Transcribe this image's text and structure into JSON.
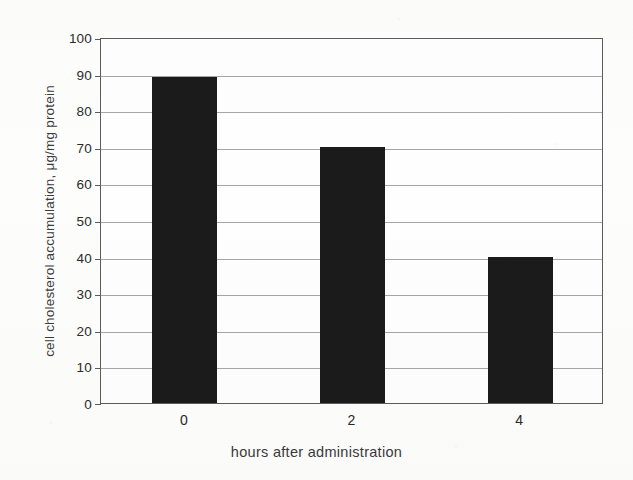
{
  "chart_data": {
    "type": "bar",
    "title": "",
    "categories": [
      "0",
      "2",
      "4"
    ],
    "values": [
      89,
      70,
      40
    ],
    "xlabel": "hours after administration",
    "ylabel": "cell cholesterol accumulation, μg/mg protein",
    "ylim": [
      0,
      100
    ],
    "ytick_labels": [
      "100",
      "90",
      "80",
      "70",
      "60",
      "50",
      "40",
      "30",
      "20",
      "10",
      "0"
    ],
    "ytick_values": [
      100,
      90,
      80,
      70,
      60,
      50,
      40,
      30,
      20,
      10,
      0
    ],
    "ytick_step": 10,
    "grid": "horizontal",
    "legend": "none",
    "series": [
      {
        "name": "cell cholesterol accumulation",
        "values": [
          89,
          70,
          40
        ],
        "color": "#1b1b1b"
      }
    ],
    "colors": {
      "bar": "#1b1b1b",
      "gridline": "#a6a6a6",
      "axis": "#5c5c5c",
      "text": "#2b2b2b",
      "background": "#fdfdfc"
    }
  }
}
